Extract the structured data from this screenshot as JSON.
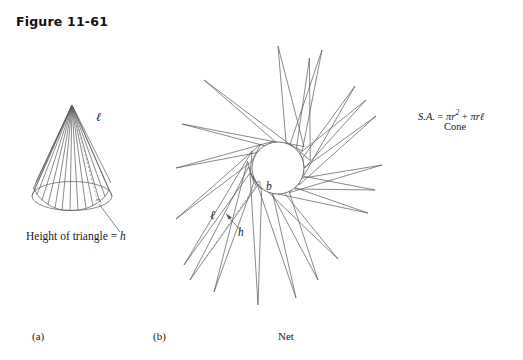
{
  "figure": {
    "title": "Figure 11-61",
    "captions": {
      "part_a": "(a)",
      "part_b": "(b)",
      "net": "Net"
    }
  },
  "cone_diagram": {
    "slant_label": "ℓ",
    "height_callout": "Height of triangle = h",
    "height_callout_plain": "Height of triangle =",
    "height_symbol": "h"
  },
  "net_diagram": {
    "base_arc_label": "b",
    "slant_label": "ℓ",
    "triangle_height_label": "h",
    "spike_count": 20
  },
  "formula": {
    "lead": "S.A.",
    "equals": "=",
    "term_one_coef": "πr",
    "term_one_exp": "2",
    "plus": "+",
    "term_two": "πrℓ",
    "full": "S.A. = πr² + πrℓ",
    "shape": "Cone"
  },
  "colors": {
    "ink": "#1a1a1a",
    "line": "#585858",
    "dashed": "#8a8a8a",
    "background": "#ffffff"
  }
}
